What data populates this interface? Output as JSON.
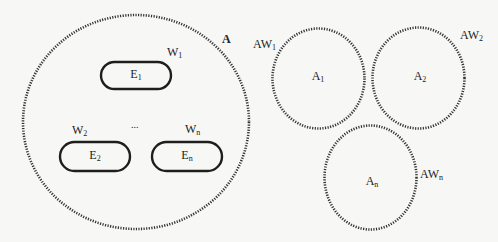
{
  "diagram": {
    "outer_region": {
      "label": "A"
    },
    "entities": [
      {
        "label": "E",
        "sub": "1",
        "weight": "W",
        "weight_sub": "1"
      },
      {
        "label": "E",
        "sub": "2",
        "weight": "W",
        "weight_sub": "2"
      },
      {
        "label": "E",
        "sub": "n",
        "weight": "W",
        "weight_sub": "n"
      }
    ],
    "ellipsis": "...",
    "sub_regions": [
      {
        "label": "A",
        "sub": "1",
        "weight": "AW",
        "weight_sub": "1"
      },
      {
        "label": "A",
        "sub": "2",
        "weight": "AW",
        "weight_sub": "2"
      },
      {
        "label": "A",
        "sub": "n",
        "weight": "AW",
        "weight_sub": "n"
      }
    ],
    "colors": {
      "stroke": "#2a2a2a",
      "background": "#f7f7f5"
    }
  }
}
